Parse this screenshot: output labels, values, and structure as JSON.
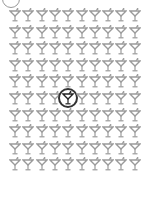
{
  "puzzle": {
    "type": "find-the-odd-one",
    "rows": 10,
    "cols": 10,
    "icon": "martini-glass-icon",
    "icon_color": "#9a9a9a",
    "odd_icon_color": "#222222",
    "odd_position": {
      "row": 5,
      "col": 4
    },
    "ring_color": "#333333"
  }
}
